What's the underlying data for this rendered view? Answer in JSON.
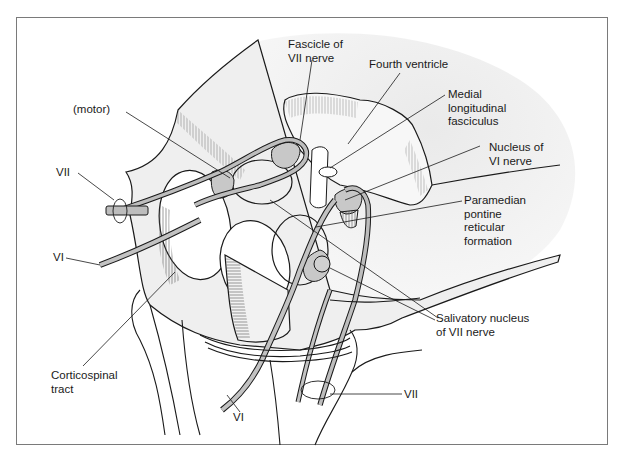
{
  "figure": {
    "colors": {
      "outline": "#1a1a1a",
      "background_tissue": "#ececec",
      "nucleus_fill": "#c8c8c8",
      "nerve_fill": "#bdbdbd",
      "frame_border": "#7a7a7a"
    }
  },
  "labels": {
    "fascicle_vii": "Fascicle of\nVII nerve",
    "fourth_ventricle": "Fourth ventricle",
    "mlf": "Medial\nlongitudinal\nfasciculus",
    "nucleus_vi": "Nucleus of\nVI nerve",
    "pprf": "Paramedian\npontine\nreticular\nformation",
    "salivatory": "Salivatory nucleus\nof VII nerve",
    "motor": "(motor)",
    "vii_left": "VII",
    "vi_left": "VI",
    "corticospinal": "Corticospinal\ntract",
    "vi_bottom": "VI",
    "vii_bottom": "VII"
  }
}
